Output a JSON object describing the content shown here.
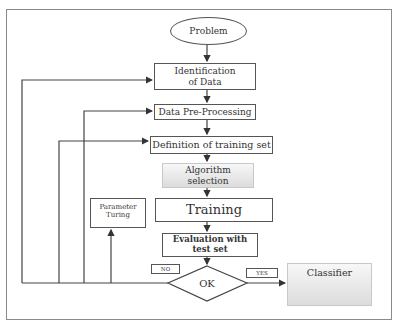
{
  "diagram": {
    "start": {
      "label": "Problem"
    },
    "steps": [
      {
        "label": "Identification of Data"
      },
      {
        "label": "Data Pre-Processing"
      },
      {
        "label": "Definition of training set"
      },
      {
        "label": "Algorithm selection"
      },
      {
        "label": "Training"
      },
      {
        "label": "Evaluation with test set"
      }
    ],
    "side_box": {
      "label": "Parameter Turing"
    },
    "decision": {
      "label": "OK"
    },
    "branches": {
      "no": "NO",
      "yes": "YES"
    },
    "result": {
      "label": "Classifier"
    }
  }
}
